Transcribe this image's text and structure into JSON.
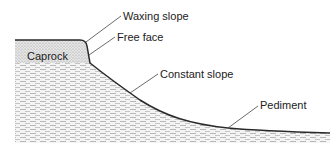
{
  "diagram": {
    "labels": {
      "waxing_slope": "Waxing slope",
      "free_face": "Free face",
      "constant_slope": "Constant slope",
      "pediment": "Pediment",
      "caprock": "Caprock"
    },
    "colors": {
      "line": "#2a2a2a",
      "caprock_fill": "#d9d9d9",
      "hatch": "#bdbdbd",
      "background": "#ffffff"
    }
  }
}
